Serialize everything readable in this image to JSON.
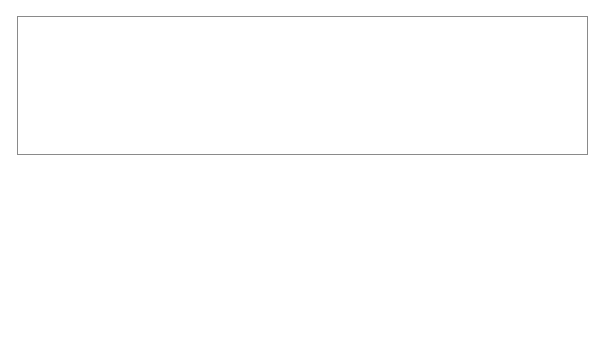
{
  "figure": {
    "labels": {
      "ground_level": "ground level",
      "sheet_piling": "sheet piling",
      "piezometers": "piezometers",
      "water_level": "water level",
      "pressure_head": "pressure head",
      "positive": "positive",
      "elevation_head_axis": "elevation head",
      "negative": "negative",
      "datum": "datum",
      "plus_ve": "+ve",
      "minus_ve_1": "−ve",
      "minus_ve_2": "−ve",
      "elevation_head_piezo": "elevation head",
      "equipotential_2_line1": "equipotential 2",
      "equipotential_2_line2": "(From Figure  3.30)",
      "total_head_max": "Total head on maximum equipotential",
      "total_head_eq2": "Total head on equipotential 2",
      "total_head_eq12": "Total head on equipotential 12",
      "note_line1": "Total head is constant along the equipotential",
      "note_line2": "Note sign of elevation head"
    },
    "equipotential_ticks": [
      "0",
      "1",
      "2",
      "3",
      "4",
      "5",
      "6",
      "7",
      "8",
      "9",
      "10",
      "11",
      "12"
    ],
    "colors": {
      "line": "#2a2a2a",
      "frame": "#8a8a8a",
      "pressure_fill": "#a9a9a9"
    }
  }
}
